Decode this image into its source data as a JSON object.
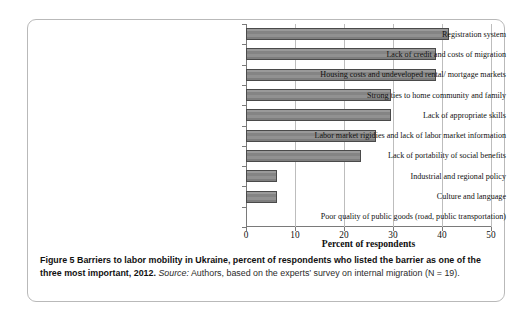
{
  "figure": {
    "caption_bold": "Figure 5 Barriers to labor mobility in Ukraine, percent of respondents who listed the barrier as one of the three most important, 2012.",
    "caption_source_label": "Source:",
    "caption_rest": " Authors, based on the experts’ survey on internal migration (N = 19)."
  },
  "chart_data": {
    "type": "bar",
    "orientation": "horizontal",
    "title": "",
    "xlabel": "Percent of respondents",
    "ylabel": "",
    "xlim": [
      0,
      50
    ],
    "xticks": [
      0,
      10,
      20,
      30,
      40,
      50
    ],
    "xtick_labels": [
      "0",
      "10",
      "20",
      "30",
      "40",
      "50"
    ],
    "grid": true,
    "legend": false,
    "bar_color": "#8c8c8c",
    "bar_edge_color": "#4a4a4a",
    "categories": [
      "Registration system",
      "Lack of credit and costs of migration",
      "Housing costs and undeveloped rental/ mortgage markets",
      "Strong ties to home community and family",
      "Lack of appropriate skills",
      "Labor market rigidies and lack of labor market information",
      "Lack of portability of social benefits",
      "Industrial and regional policy",
      "Culture and language",
      "Poor quality of public goods (road, public transportation)"
    ],
    "values": [
      41.4,
      38.8,
      38.8,
      29.6,
      29.6,
      26.5,
      23.5,
      6.3,
      6.3,
      0
    ]
  }
}
